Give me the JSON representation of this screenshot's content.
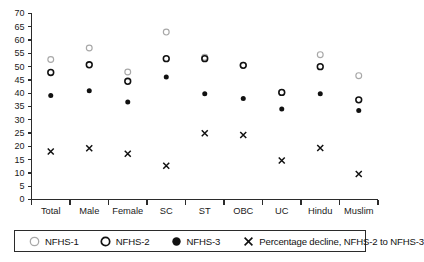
{
  "chart_data": {
    "type": "scatter",
    "title": "",
    "subtitle": "",
    "xlabel": "",
    "ylabel": "",
    "ylim": [
      0,
      70
    ],
    "yticks": [
      0,
      5,
      10,
      15,
      20,
      25,
      30,
      35,
      40,
      45,
      50,
      55,
      60,
      65,
      70
    ],
    "grid": false,
    "legend_position": "bottom",
    "categories": [
      "Total",
      "Male",
      "Female",
      "SC",
      "ST",
      "OBC",
      "UC",
      "Hindu",
      "Muslim"
    ],
    "series": [
      {
        "name": "NFHS-1",
        "marker": "open-circle-gray",
        "color": "#a8a8a8",
        "values": [
          52.7,
          57.0,
          48.0,
          63.0,
          53.5,
          50.5,
          40.3,
          54.5,
          46.6
        ]
      },
      {
        "name": "NFHS-2",
        "marker": "open-circle-black",
        "color": "#111111",
        "values": [
          47.8,
          50.7,
          44.5,
          53.0,
          53.0,
          50.5,
          40.3,
          50.0,
          37.5
        ]
      },
      {
        "name": "NFHS-3",
        "marker": "filled-circle-black",
        "color": "#111111",
        "values": [
          39.1,
          40.9,
          36.7,
          46.1,
          39.8,
          38.0,
          34.1,
          39.8,
          33.5
        ]
      },
      {
        "name": "Percentage decline, NFHS-2 to NFHS-3",
        "marker": "x-cross",
        "color": "#111111",
        "values": [
          18.1,
          19.3,
          17.2,
          12.7,
          24.9,
          24.3,
          14.7,
          19.4,
          9.6
        ]
      }
    ]
  },
  "legend": {
    "items": [
      {
        "label": "NFHS-1",
        "marker": "open-circle-gray"
      },
      {
        "label": "NFHS-2",
        "marker": "open-circle-black"
      },
      {
        "label": "NFHS-3",
        "marker": "filled-circle-black"
      },
      {
        "label": "Percentage decline, NFHS-2 to NFHS-3",
        "marker": "x-cross"
      }
    ]
  },
  "colors": {
    "nfhs1": "#a8a8a8",
    "nfhs2": "#111111",
    "nfhs3": "#111111",
    "decline": "#111111",
    "axis": "#2b2b2b",
    "background": "#ffffff"
  }
}
